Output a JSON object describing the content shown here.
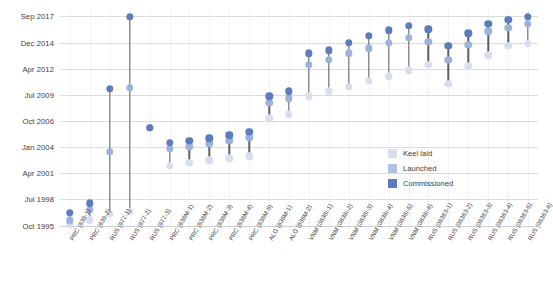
{
  "chart_data": {
    "type": "scatter",
    "subtype": "dumbbell-timeline",
    "title": "",
    "xlabel": "",
    "ylabel": "",
    "grid": true,
    "legend_position": "inside-lower-right",
    "y_axis": {
      "tick_labels": [
        "Oct 1995",
        "Jul 1998",
        "Apr 2001",
        "Jan 2004",
        "Oct 2006",
        "Jul 2009",
        "Apr 2012",
        "Dec 2014",
        "Sep 2017"
      ],
      "ylim": [
        "Oct 1995",
        "Sep 2017"
      ]
    },
    "categories": [
      "PRC (636-1)",
      "PRC (636-2)",
      "RUS (677-1)",
      "RUS (677-2)",
      "RUS (677-3)",
      "PRC (636M-1)",
      "PRC (636M-2)",
      "PRC (636M-3)",
      "PRC (636M-4)",
      "PRC (636M-5)",
      "ALG (636M-1)",
      "ALG (636M-2)",
      "VNM (0636I-1)",
      "VNM (0636I-2)",
      "VNM (0636I-3)",
      "VNM (0636I-4)",
      "VNM (0636I-5)",
      "VNM (0636I-6)",
      "RUS (06363-1)",
      "RUS (06363-2)",
      "RUS (06363-3)",
      "RUS (06363-4)",
      "RUS (06363-5)",
      "RUS (06363-6)"
    ],
    "series": [
      {
        "name": "Keel laid",
        "color": "#d8deee",
        "values": [
          1995.9,
          1996.3,
          1997.0,
          1997.2,
          2006.0,
          2002.0,
          2002.3,
          2002.6,
          2002.8,
          2003.0,
          2007.0,
          2007.4,
          2009.3,
          2009.8,
          2010.3,
          2010.9,
          2011.4,
          2012.0,
          2012.6,
          2010.6,
          2012.5,
          2013.6,
          2014.6,
          2014.8
        ]
      },
      {
        "name": "Launched",
        "color": "#9db2d8",
        "values": [
          1996.3,
          1997.4,
          2003.5,
          2010.2,
          2006.0,
          2003.8,
          2004.0,
          2004.3,
          2004.6,
          2005.0,
          2008.6,
          2009.1,
          2012.6,
          2013.1,
          2013.8,
          2014.3,
          2014.9,
          2015.4,
          2015.0,
          2013.1,
          2014.7,
          2016.1,
          2016.5,
          2016.9
        ]
      },
      {
        "name": "Commissioned",
        "color": "#5b7cbe",
        "values": [
          1997.1,
          1998.1,
          2010.1,
          2017.6,
          2006.0,
          2004.4,
          2004.6,
          2004.9,
          2005.2,
          2005.6,
          2009.3,
          2009.8,
          2013.8,
          2014.1,
          2014.9,
          2015.6,
          2016.2,
          2016.7,
          2016.3,
          2014.6,
          2015.9,
          2016.9,
          2017.3,
          2017.6
        ]
      }
    ],
    "legend": [
      {
        "label": "Keel laid",
        "color": "#d8deee"
      },
      {
        "label": "Launched",
        "color": "#b3c1e0"
      },
      {
        "label": "Commissioned",
        "color": "#5b7cbe"
      }
    ]
  }
}
